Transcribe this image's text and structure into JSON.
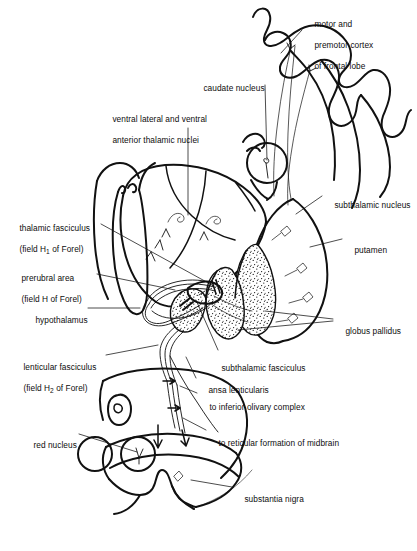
{
  "figure": {
    "ink_color": "#111111",
    "background_color": "#ffffff"
  },
  "labels": [
    {
      "id": "motor-premotor-cortex",
      "name": "motor-and-premotor-cortex-label",
      "lines": [
        "motor and",
        "premotor cortex",
        "of frontal lobe"
      ],
      "x": 305,
      "y": 9
    },
    {
      "id": "caudate-nucleus",
      "name": "caudate-nucleus-label",
      "lines": [
        "caudate nucleus"
      ],
      "x": 194,
      "y": 73
    },
    {
      "id": "ventral-lateral-anterior-thalamic-nuclei",
      "name": "ventral-lateral-and-ventral-anterior-thalamic-nuclei-label",
      "lines": [
        "ventral lateral and ventral",
        "anterior thalamic nuclei"
      ],
      "x": 103,
      "y": 104
    },
    {
      "id": "subthalamic-nucleus",
      "name": "subthalamic-nucleus-label",
      "lines": [
        "subthalamic nucleus"
      ],
      "x": 325,
      "y": 190
    },
    {
      "id": "putamen",
      "name": "putamen-label",
      "lines": [
        "putamen"
      ],
      "x": 345,
      "y": 235
    },
    {
      "id": "thalamic-fasciculus",
      "name": "thalamic-fasciculus-label",
      "lines": [
        "thalamic fasciculus",
        "(field H<sub>1</sub> of Forel)"
      ],
      "x": 10,
      "y": 213
    },
    {
      "id": "prerubral-area",
      "name": "prerubral-area-label",
      "lines": [
        "prerubral area",
        "(field H of Forel)"
      ],
      "x": 12,
      "y": 263
    },
    {
      "id": "hypothalamus",
      "name": "hypothalamus-label",
      "lines": [
        "hypothalamus"
      ],
      "x": 26,
      "y": 305
    },
    {
      "id": "globus-pallidus",
      "name": "globus-pallidus-label",
      "lines": [
        "globus pallidus"
      ],
      "x": 336,
      "y": 316
    },
    {
      "id": "lenticular-fasciculus",
      "name": "lenticular-fasciculus-label",
      "lines": [
        "lenticular fasciculus",
        "(field H<sub>2</sub> of Forel)"
      ],
      "x": 14,
      "y": 352
    },
    {
      "id": "subthalamic-fasciculus",
      "name": "subthalamic-fasciculus-label",
      "lines": [
        "subthalamic fasciculus"
      ],
      "x": 212,
      "y": 353
    },
    {
      "id": "ansa-lenticularis",
      "name": "ansa-lenticularis-label",
      "lines": [
        "ansa lenticularis"
      ],
      "x": 199,
      "y": 375
    },
    {
      "id": "to-inferior-olivary-complex",
      "name": "to-inferior-olivary-complex-label",
      "lines": [
        "to inferior olivary complex"
      ],
      "x": 200,
      "y": 392
    },
    {
      "id": "red-nucleus",
      "name": "red-nucleus-label",
      "lines": [
        "red nucleus"
      ],
      "x": 24,
      "y": 430
    },
    {
      "id": "to-reticular-formation-of-midbrain",
      "name": "to-reticular-formation-of-midbrain-label",
      "lines": [
        "to reticular formation of midbrain"
      ],
      "x": 209,
      "y": 428
    },
    {
      "id": "substantia-nigra",
      "name": "substantia-nigra-label",
      "lines": [
        "substantia nigra"
      ],
      "x": 235,
      "y": 484
    }
  ],
  "structures": [
    {
      "id": "cerebral-cortex",
      "name": "cerebral-cortex-gyri"
    },
    {
      "id": "caudate-nucleus-body",
      "name": "caudate-nucleus-circle"
    },
    {
      "id": "thalamus",
      "name": "thalamus-outline"
    },
    {
      "id": "putamen-body",
      "name": "putamen-outline"
    },
    {
      "id": "globus-pallidus-lateral",
      "name": "globus-pallidus-lateral-segment"
    },
    {
      "id": "globus-pallidus-medial",
      "name": "globus-pallidus-medial-segment"
    },
    {
      "id": "subthalamic-nucleus-body",
      "name": "subthalamic-nucleus-shape"
    },
    {
      "id": "hypothalamus-body",
      "name": "hypothalamus-outline"
    },
    {
      "id": "midbrain",
      "name": "midbrain-cross-section"
    },
    {
      "id": "red-nucleus-left",
      "name": "red-nucleus-left-circle"
    },
    {
      "id": "red-nucleus-right",
      "name": "red-nucleus-right-circle"
    },
    {
      "id": "cerebral-aqueduct",
      "name": "cerebral-aqueduct-shape"
    },
    {
      "id": "substantia-nigra-band",
      "name": "substantia-nigra-band"
    }
  ]
}
